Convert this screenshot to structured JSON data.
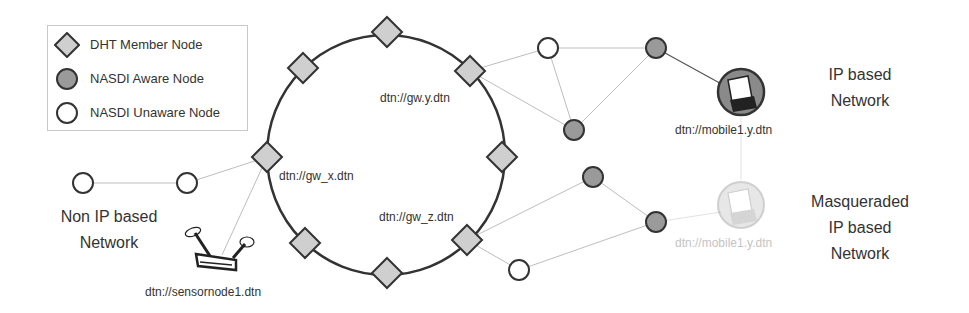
{
  "legend": {
    "items": [
      {
        "label": "DHT Member Node",
        "icon": "diamond-icon",
        "fill": "#cfcfcf"
      },
      {
        "label": "NASDI Aware Node",
        "icon": "filled-circle-icon",
        "fill": "#9a9a9a"
      },
      {
        "label": "NASDI Unaware Node",
        "icon": "empty-circle-icon",
        "fill": "#ffffff"
      }
    ]
  },
  "ring": {
    "gateways": {
      "gw_x": "dtn://gw_x.dtn",
      "gw_y": "dtn://gw.y.dtn",
      "gw_z": "dtn://gw_z.dtn"
    }
  },
  "nodes": {
    "sensor": "dtn://sensornode1.dtn",
    "mobile": "dtn://mobile1.y.dtn",
    "mobile_masq": "dtn://mobile1.y.dtn"
  },
  "regions": {
    "non_ip": [
      "Non IP based",
      "Network"
    ],
    "ip": [
      "IP based",
      "Network"
    ],
    "masq": [
      "Masqueraded",
      "IP based",
      "Network"
    ]
  },
  "colors": {
    "ring_stroke": "#333333",
    "diamond_fill": "#cfcfcf",
    "aware_fill": "#9a9a9a",
    "link": "#bdbdbd",
    "faded": "#c8c8c8"
  }
}
